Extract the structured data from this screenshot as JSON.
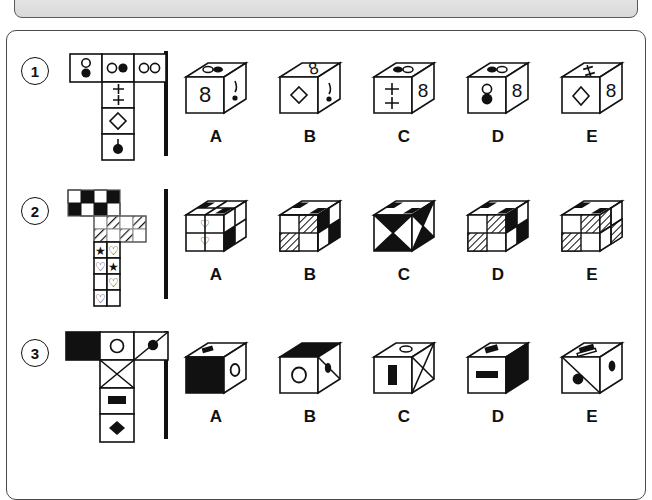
{
  "window": {
    "top_bar_present": true,
    "panel_background": "#ffffff",
    "ink_color": "#111111"
  },
  "puzzle": {
    "type": "cube-folding-visual-reasoning",
    "option_labels": [
      "A",
      "B",
      "C",
      "D",
      "E"
    ],
    "rows": [
      {
        "number": "1",
        "net": {
          "shape": "T-net",
          "description": "three cells across the top, two cells below the middle column",
          "cells": [
            {
              "position": "top-left",
              "symbol": "vertical-dumbbell-white-top-black-bottom"
            },
            {
              "position": "top-middle",
              "symbol": "two-circles-horizontal-white-left-black-right"
            },
            {
              "position": "top-right",
              "symbol": "two-circles-horizontal-both-white"
            },
            {
              "position": "middle-1",
              "symbol": "double-plus-sign"
            },
            {
              "position": "middle-2",
              "symbol": "diamond-outline"
            },
            {
              "position": "bottom",
              "symbol": "pin-black-circle-with-stem"
            }
          ]
        },
        "options": [
          {
            "label": "A",
            "top": "two-circles-horizontal",
            "left": "figure-eight",
            "right": "exclamation-pin"
          },
          {
            "label": "B",
            "top": "figure-eight",
            "left": "diamond-outline",
            "right": "exclamation-pin"
          },
          {
            "label": "C",
            "top": "two-circles-horizontal",
            "left": "double-plus-sign",
            "right": "figure-eight"
          },
          {
            "label": "D",
            "top": "two-circles-horizontal",
            "left": "pin-black-circle-with-stem",
            "right": "figure-eight"
          },
          {
            "label": "E",
            "top": "double-plus-sign",
            "left": "diamond-outline",
            "right": "figure-eight"
          }
        ]
      },
      {
        "number": "2",
        "net": {
          "shape": "irregular-net",
          "description": "checkerboard block top-left, hatched block at right, star and heart cells down the stem",
          "cells": [
            {
              "position": "top-block",
              "symbol": "checkerboard-2x2-pattern"
            },
            {
              "position": "right-block",
              "symbol": "diagonal-hatched-pattern"
            },
            {
              "position": "stem-1",
              "symbol": "star-and-heart"
            },
            {
              "position": "stem-2",
              "symbol": "heart-and-star"
            },
            {
              "position": "stem-3",
              "symbol": "heart-outline"
            },
            {
              "position": "stem-4",
              "symbol": "heart-outline"
            }
          ]
        },
        "options": [
          {
            "label": "A",
            "top": "checkerboard",
            "left": "hearts-quadrants",
            "right": "black-white-split"
          },
          {
            "label": "B",
            "top": "checkerboard",
            "left": "hatched-quadrants",
            "right": "black-white-checker"
          },
          {
            "label": "C",
            "top": "checkerboard",
            "left": "black-triangles-hourglass",
            "right": "black-white-triangles"
          },
          {
            "label": "D",
            "top": "checkerboard",
            "left": "hatched-quadrants",
            "right": "black-white-checker"
          },
          {
            "label": "E",
            "top": "checkerboard",
            "left": "hatched-quadrants",
            "right": "hatched-grey"
          }
        ]
      },
      {
        "number": "3",
        "net": {
          "shape": "T-net",
          "description": "solid black cell, circle outline, diagonal line with filled dot across the top; X, black bar and black diamond down the stem",
          "cells": [
            {
              "position": "top-left",
              "symbol": "solid-black"
            },
            {
              "position": "top-middle",
              "symbol": "circle-outline"
            },
            {
              "position": "top-right",
              "symbol": "diagonal-line-with-black-dot"
            },
            {
              "position": "stem-1",
              "symbol": "x-cross-diagonals"
            },
            {
              "position": "stem-2",
              "symbol": "black-horizontal-bar"
            },
            {
              "position": "stem-3",
              "symbol": "black-diamond"
            }
          ]
        },
        "options": [
          {
            "label": "A",
            "top": "black-bar",
            "left": "solid-black",
            "right": "circle-outline"
          },
          {
            "label": "B",
            "top": "solid-black",
            "left": "circle-outline",
            "right": "black-dot-on-diagonal"
          },
          {
            "label": "C",
            "top": "circle-outline",
            "left": "black-vertical-bar",
            "right": "x-cross-diagonals"
          },
          {
            "label": "D",
            "top": "black-bar",
            "left": "black-horizontal-bar",
            "right": "solid-black"
          },
          {
            "label": "E",
            "top": "black-bar-outline",
            "left": "black-dot-on-diagonal",
            "right": "black-dot"
          }
        ]
      }
    ]
  }
}
